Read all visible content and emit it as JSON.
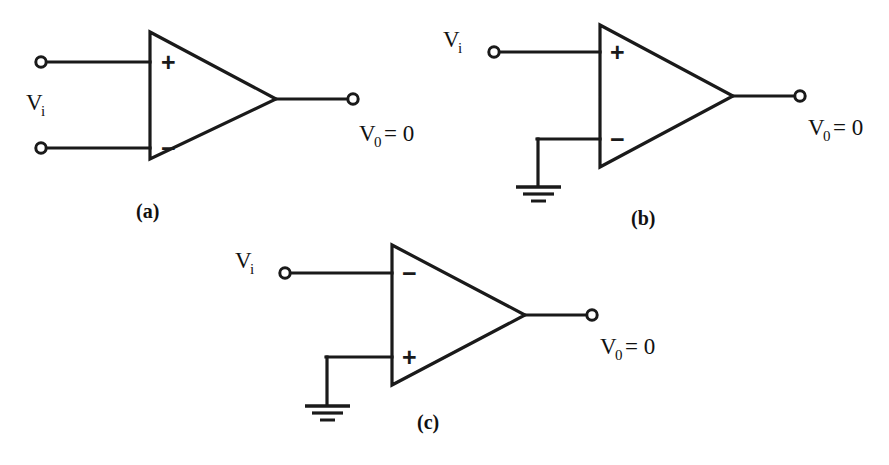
{
  "figure": {
    "background_color": "#ffffff",
    "line_color": "#1a1a1a",
    "panels": [
      {
        "id": "a",
        "caption": "(a)",
        "input_label": "V",
        "input_subscript": "i",
        "output_label": "V",
        "output_subscript": "0",
        "output_equation": "= 0",
        "top_input_sign": "+",
        "bottom_input_sign": "−",
        "grounded_input": "none",
        "input_terminal_count": 2,
        "output_terminal_count": 1
      },
      {
        "id": "b",
        "caption": "(b)",
        "input_label": "V",
        "input_subscript": "i",
        "output_label": "V",
        "output_subscript": "0",
        "output_equation": "= 0",
        "top_input_sign": "+",
        "bottom_input_sign": "−",
        "grounded_input": "bottom",
        "input_terminal_count": 1,
        "output_terminal_count": 1
      },
      {
        "id": "c",
        "caption": "(c)",
        "input_label": "V",
        "input_subscript": "i",
        "output_label": "V",
        "output_subscript": "0",
        "output_equation": "= 0",
        "top_input_sign": "−",
        "bottom_input_sign": "+",
        "grounded_input": "bottom",
        "input_terminal_count": 1,
        "output_terminal_count": 1
      }
    ]
  }
}
